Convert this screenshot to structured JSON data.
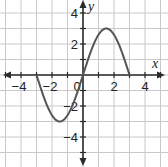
{
  "chart_data": {
    "type": "line",
    "title": "",
    "xlabel": "x",
    "ylabel": "y",
    "xlim": [
      -5,
      5
    ],
    "ylim": [
      -5,
      5
    ],
    "grid": true,
    "x_ticks": [
      -4,
      -2,
      0,
      2,
      4
    ],
    "x_tick_labels": [
      "−4",
      "−2",
      "0",
      "2",
      "4"
    ],
    "y_ticks": [
      4,
      2,
      -2,
      -4
    ],
    "y_tick_labels": [
      "4",
      "2",
      "−2",
      "−4"
    ],
    "series": [
      {
        "name": "f(x)",
        "description": "sinusoid-like curve from (-3,0) down to min (-1.5,-3), through origin, up to max (1.5,3), back to (3,0)",
        "x": [
          -3,
          -2.5,
          -2,
          -1.5,
          -1,
          -0.5,
          0,
          0.5,
          1,
          1.5,
          2,
          2.5,
          3
        ],
        "y": [
          0,
          -1.5,
          -2.6,
          -3,
          -2.6,
          -1.5,
          0,
          1.5,
          2.6,
          3,
          2.6,
          1.5,
          0
        ]
      }
    ],
    "key_points": [
      {
        "x": -3,
        "y": 0
      },
      {
        "x": -1.5,
        "y": -3
      },
      {
        "x": 0,
        "y": 0
      },
      {
        "x": 1.5,
        "y": 3
      },
      {
        "x": 3,
        "y": 0
      }
    ]
  }
}
